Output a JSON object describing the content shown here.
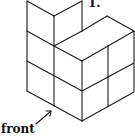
{
  "figure": {
    "problem_number": "1.",
    "front_label": "front",
    "arrow": "arrow pointing to the front vertical edge",
    "stroke_color": "#1a1a1a",
    "background": "#ffffff"
  }
}
